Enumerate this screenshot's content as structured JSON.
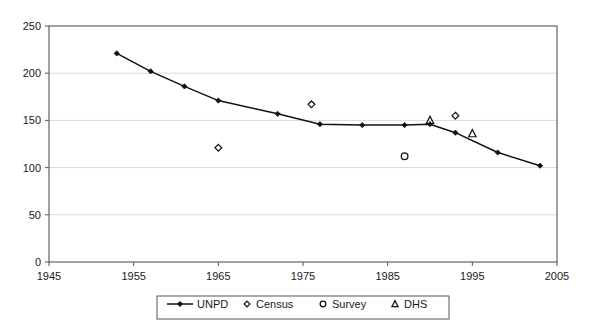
{
  "chart_data": {
    "type": "line",
    "title": "",
    "xlabel": "",
    "ylabel": "",
    "xlim": [
      1945,
      2005
    ],
    "ylim": [
      0,
      250
    ],
    "xticks": [
      1945,
      1955,
      1965,
      1975,
      1985,
      1995,
      2005
    ],
    "yticks": [
      0,
      50,
      100,
      150,
      200,
      250
    ],
    "grid": "horizontal",
    "legend_position": "bottom",
    "series": [
      {
        "name": "UNPD",
        "marker": "line-with-diamond",
        "points": [
          {
            "x": 1953,
            "y": 221
          },
          {
            "x": 1957,
            "y": 202
          },
          {
            "x": 1961,
            "y": 186
          },
          {
            "x": 1965,
            "y": 171
          },
          {
            "x": 1972,
            "y": 157
          },
          {
            "x": 1977,
            "y": 146
          },
          {
            "x": 1982,
            "y": 145
          },
          {
            "x": 1987,
            "y": 145
          },
          {
            "x": 1990,
            "y": 146
          },
          {
            "x": 1993,
            "y": 137
          },
          {
            "x": 1998,
            "y": 116
          },
          {
            "x": 2003,
            "y": 102
          }
        ]
      },
      {
        "name": "Census",
        "marker": "diamond-outline",
        "points": [
          {
            "x": 1965,
            "y": 121
          },
          {
            "x": 1976,
            "y": 167
          },
          {
            "x": 1993,
            "y": 155
          }
        ]
      },
      {
        "name": "Survey",
        "marker": "circle-outline",
        "points": [
          {
            "x": 1987,
            "y": 112
          }
        ]
      },
      {
        "name": "DHS",
        "marker": "triangle-outline",
        "points": [
          {
            "x": 1990,
            "y": 150
          },
          {
            "x": 1995,
            "y": 136
          }
        ]
      }
    ]
  },
  "axes": {
    "y_labels": [
      "250",
      "200",
      "150",
      "100",
      "50",
      "0"
    ],
    "x_labels": [
      "1945",
      "1955",
      "1965",
      "1975",
      "1985",
      "1995",
      "2005"
    ]
  },
  "legend": {
    "items": [
      {
        "label": "UNPD",
        "marker": "line-with-diamond"
      },
      {
        "label": "Census",
        "marker": "diamond-outline"
      },
      {
        "label": "Survey",
        "marker": "circle-outline"
      },
      {
        "label": "DHS",
        "marker": "triangle-outline"
      }
    ]
  },
  "colors": {
    "series_line": "#111111",
    "marker": "#111111",
    "grid": "#d9d9d9",
    "axis": "#555555",
    "background": "#ffffff"
  }
}
